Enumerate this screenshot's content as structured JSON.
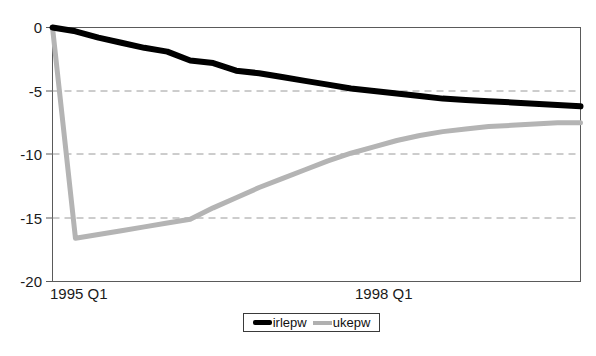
{
  "chart_data": {
    "type": "line",
    "title": "",
    "xlabel": "",
    "ylabel": "",
    "ylim": [
      -20,
      0
    ],
    "yticks": [
      0,
      -5,
      -10,
      -15,
      -20
    ],
    "ytick_labels": [
      "0",
      "-5",
      "-10",
      "-15",
      "-20"
    ],
    "xtick_labels": [
      "1995 Q1",
      "1998 Q1"
    ],
    "grid": "horizontal-dashed",
    "legend_position": "bottom-center",
    "x": [
      0,
      1,
      2,
      3,
      4,
      5,
      6,
      7,
      8,
      9,
      10,
      11,
      12,
      13,
      14,
      15,
      16,
      17,
      18,
      19,
      20,
      21,
      22,
      23
    ],
    "series": [
      {
        "name": "irlepw",
        "color": "#000000",
        "values": [
          0.0,
          -0.3,
          -0.8,
          -1.2,
          -1.6,
          -1.9,
          -2.6,
          -2.8,
          -3.4,
          -3.6,
          -3.9,
          -4.2,
          -4.5,
          -4.8,
          -5.0,
          -5.2,
          -5.4,
          -5.6,
          -5.7,
          -5.8,
          -5.9,
          -6.0,
          -6.1,
          -6.2
        ]
      },
      {
        "name": "ukepw",
        "color": "#b4b4b4",
        "values": [
          0.0,
          -16.6,
          -16.3,
          -16.0,
          -15.7,
          -15.4,
          -15.1,
          -14.2,
          -13.4,
          -12.6,
          -11.9,
          -11.2,
          -10.5,
          -9.9,
          -9.4,
          -8.9,
          -8.5,
          -8.2,
          -8.0,
          -7.8,
          -7.7,
          -7.6,
          -7.5,
          -7.5
        ]
      }
    ]
  },
  "legend": {
    "items": [
      {
        "label": "irlepw",
        "style": "thick-black-line"
      },
      {
        "label": "ukepw",
        "style": "gray-line"
      }
    ]
  },
  "axes": {
    "x_label_left": "1995 Q1",
    "x_label_right": "1998 Q1"
  },
  "colors": {
    "series_irlepw": "#000000",
    "series_ukepw": "#b4b4b4",
    "gridline": "#9a9a9a",
    "axis": "#555555",
    "text": "#1a1a1a"
  }
}
